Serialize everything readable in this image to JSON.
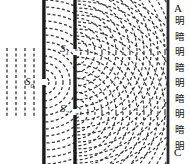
{
  "figure": {
    "labels": {
      "source_slit": "S",
      "source_slit_sub": "0",
      "slit1": "S",
      "slit1_sub": "1",
      "slit2": "S",
      "slit2_sub": "2",
      "screen_top": "A",
      "screen_bottom": "C"
    },
    "screen_fringes": [
      "明",
      "暗",
      "明",
      "暗",
      "明",
      "暗",
      "明",
      "暗",
      "明"
    ],
    "colors": {
      "ink": "#111111",
      "barrier": "#1a1a1a",
      "wave": "#333333",
      "background": "#ffffff"
    },
    "geometry": {
      "plane_wave_lines": 4,
      "barrier1_x": 44,
      "barrier2_x": 75,
      "screen_x": 168,
      "slit0_y": 82,
      "slit1_y": 52,
      "slit2_y": 112,
      "wave_spacing": 7
    }
  }
}
